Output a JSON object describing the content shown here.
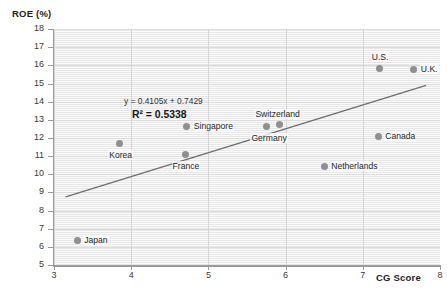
{
  "chart_data": {
    "type": "scatter",
    "title": "",
    "xlabel": "CG Score",
    "ylabel": "ROE (%)",
    "xlim": [
      3,
      8
    ],
    "ylim": [
      5,
      18
    ],
    "xticks": [
      3,
      4,
      5,
      6,
      7,
      8
    ],
    "yticks": [
      5,
      6,
      7,
      8,
      9,
      10,
      11,
      12,
      13,
      14,
      15,
      16,
      17,
      18
    ],
    "grid": true,
    "legend": "none",
    "point_color": "#8f8f8f",
    "trendline_color": "#6e6e6e",
    "annotations": {
      "equation": "y = 0.4105x + 0.7429",
      "r_squared": "R² = 0.5338",
      "slope": 0.4105,
      "intercept": 0.7429,
      "r2_value": 0.5338
    },
    "trendline": {
      "x0": 3.15,
      "y0": 8.75,
      "x1": 7.82,
      "y1": 14.9
    },
    "points": [
      {
        "label": "Japan",
        "x": 3.3,
        "y": 6.35,
        "label_pos": "right"
      },
      {
        "label": "Korea",
        "x": 3.85,
        "y": 11.7,
        "label_pos": "below"
      },
      {
        "label": "France",
        "x": 4.7,
        "y": 11.1,
        "label_pos": "below"
      },
      {
        "label": "Singapore",
        "x": 4.72,
        "y": 12.65,
        "label_pos": "right"
      },
      {
        "label": "Germany",
        "x": 5.75,
        "y": 12.65,
        "label_pos": "below"
      },
      {
        "label": "Switzerland",
        "x": 5.92,
        "y": 12.72,
        "label_pos": "above"
      },
      {
        "label": "Netherlands",
        "x": 6.5,
        "y": 10.45,
        "label_pos": "right"
      },
      {
        "label": "Canada",
        "x": 7.2,
        "y": 12.1,
        "label_pos": "right"
      },
      {
        "label": "U.S.",
        "x": 7.22,
        "y": 15.85,
        "label_pos": "above"
      },
      {
        "label": "U.K.",
        "x": 7.66,
        "y": 15.78,
        "label_pos": "right"
      }
    ]
  }
}
